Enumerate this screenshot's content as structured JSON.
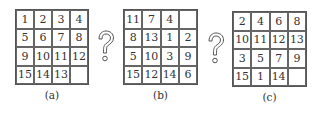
{
  "puzzles": [
    {
      "label": "(a)",
      "rows": [
        [
          "1",
          "2",
          "3",
          "4"
        ],
        [
          "5",
          "6",
          "7",
          "8"
        ],
        [
          "9",
          "10",
          "11",
          "12"
        ],
        [
          "15",
          "14",
          "13",
          ""
        ]
      ]
    },
    {
      "label": "(b)",
      "rows": [
        [
          "11",
          "7",
          "4",
          ""
        ],
        [
          "8",
          "13",
          "1",
          "2"
        ],
        [
          "5",
          "10",
          "3",
          "9"
        ],
        [
          "15",
          "12",
          "14",
          "6"
        ]
      ]
    },
    {
      "label": "(c)",
      "rows": [
        [
          "2",
          "4",
          "6",
          "8"
        ],
        [
          "10",
          "11",
          "12",
          "13"
        ],
        [
          "3",
          "5",
          "7",
          "9"
        ],
        [
          "15",
          "1",
          "14",
          ""
        ]
      ]
    }
  ],
  "connectors": [
    {
      "icon": "question-mark-icon",
      "glyph": "?"
    },
    {
      "icon": "question-mark-icon",
      "glyph": "?"
    }
  ]
}
